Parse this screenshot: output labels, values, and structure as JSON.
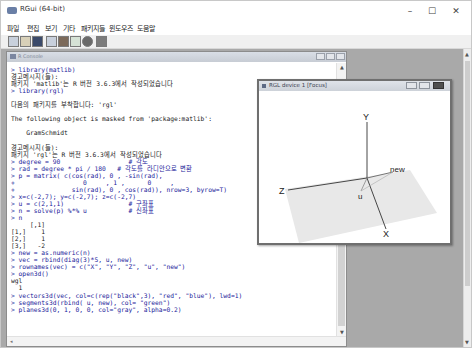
{
  "window": {
    "title": "RGui (64-bit)",
    "controls": {
      "minimize": "–",
      "maximize": "☐",
      "close": "✕"
    }
  },
  "menubar": {
    "items": [
      "파일",
      "편집",
      "보기",
      "기타",
      "패키지들",
      "윈도우즈",
      "도움말"
    ]
  },
  "toolbar": {
    "buttons": [
      "open-script",
      "load-workspace",
      "save-workspace",
      "copy",
      "paste",
      "copy-paste",
      "stop",
      "print"
    ]
  },
  "console": {
    "title": "R Console",
    "lines": [
      {
        "t": "> library(matlib)",
        "k": "in"
      },
      {
        "t": "경고메시지(들):",
        "k": "out"
      },
      {
        "t": "패키지 'matlib'는 R 버전 3.6.3에서 작성되었습니다",
        "k": "out"
      },
      {
        "t": "> library(rgl)",
        "k": "in"
      },
      {
        "t": "",
        "k": "blank"
      },
      {
        "t": "다음의 패키지를 부착합니다: 'rgl'",
        "k": "out"
      },
      {
        "t": "",
        "k": "blank"
      },
      {
        "t": "The following object is masked from 'package:matlib':",
        "k": "out"
      },
      {
        "t": "",
        "k": "blank"
      },
      {
        "t": "    GramSchmidt",
        "k": "out"
      },
      {
        "t": "",
        "k": "blank"
      },
      {
        "t": "경고메시지(들):",
        "k": "out"
      },
      {
        "t": "패키지 'rgl'는 R 버전 3.6.3에서 작성되었습니다",
        "k": "out"
      },
      {
        "t": "> degree = 90                  # 각도",
        "k": "in"
      },
      {
        "t": "> rad = degree * pi / 180   # 각도를 라디안으로 변환",
        "k": "in"
      },
      {
        "t": "> p = matrix( c(cos(rad), 0 , -sin(rad),",
        "k": "in"
      },
      {
        "t": "+                  0     , 1 ,      0     ,",
        "k": "in"
      },
      {
        "t": "+               sin(rad), 0 , cos(rad)), nrow=3, byrow=T)",
        "k": "in"
      },
      {
        "t": "> x=c(-2,7); y=c(-2,7); z=c(-2,7)",
        "k": "in"
      },
      {
        "t": "> u = c(2,1,1)                 # 구좌표",
        "k": "in"
      },
      {
        "t": "> n = solve(p) %*% u           # 신좌표",
        "k": "in"
      },
      {
        "t": "> n",
        "k": "in"
      },
      {
        "t": "     [,1]",
        "k": "out"
      },
      {
        "t": "[1,]    1",
        "k": "out"
      },
      {
        "t": "[2,]    1",
        "k": "out"
      },
      {
        "t": "[3,]   -2",
        "k": "out"
      },
      {
        "t": "> new = as.numeric(n)",
        "k": "in"
      },
      {
        "t": "> vec = rbind(diag(3)*5, u, new)",
        "k": "in"
      },
      {
        "t": "> rownames(vec) = c(\"X\", \"Y\", \"Z\", \"u\", \"new\")",
        "k": "in"
      },
      {
        "t": "> open3d()",
        "k": "in"
      },
      {
        "t": "wgl",
        "k": "out"
      },
      {
        "t": "  1",
        "k": "out"
      },
      {
        "t": "> vectors3d(vec, col=c(rep(\"black\",3), \"red\", \"blue\"), lwd=1)",
        "k": "in"
      },
      {
        "t": "> segments3d(rbind( u, new), col= \"green\")",
        "k": "in"
      },
      {
        "t": "> planes3d(0, 1, 0, 0, col=\"gray\", alpha=0.2)",
        "k": "in"
      }
    ]
  },
  "rgl": {
    "title": "RGL device 1 [Focus]",
    "labels": {
      "x": "X",
      "y": "Y",
      "z": "Z",
      "u": "u",
      "new": "new"
    },
    "plane_color": "#e8e8e8",
    "axis_color": "#333333"
  },
  "colors": {
    "input_text": "#1a1a9a",
    "output_text": "#1a1a1a",
    "mdi_background": "#a9a9a9"
  }
}
